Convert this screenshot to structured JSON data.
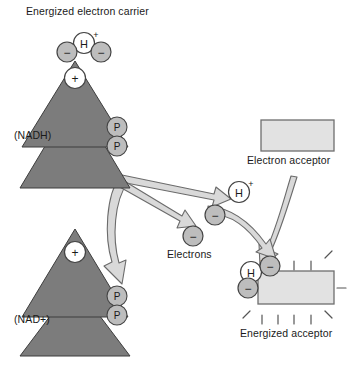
{
  "figure": {
    "kind": "biology-diagram",
    "topic": "Electron transfer from NADH to an electron acceptor"
  },
  "labels": {
    "title": "Energized electron carrier",
    "carrier_reduced": "(NADH)",
    "carrier_oxidized": "(NAD+)",
    "electrons": "Electrons",
    "electron_acceptor": "Electron acceptor",
    "energized_acceptor": "Energized acceptor"
  },
  "glyphs": {
    "hydrogen": "H",
    "plus": "+",
    "minus": "−",
    "phosphate": "P",
    "superscript_plus": "+"
  },
  "colors": {
    "triangle_fill": "#7c7c7c",
    "triangle_stroke": "#3d3d3d",
    "circle_gray_fill": "#bdbdbd",
    "circle_white_fill": "#ffffff",
    "circle_stroke": "#444444",
    "box_fill": "#e2e2e2",
    "box_stroke": "#6e6e6e",
    "arrow_fill": "#d9d9d9",
    "arrow_stroke": "#6b6b6b",
    "text": "#1a1a1a",
    "background": "#ffffff"
  },
  "nodes": {
    "nadh": {
      "label": "(NADH)",
      "charge": "+",
      "has_hydrogen": true,
      "electrons_attached": 2,
      "phosphates": 2
    },
    "nad_plus": {
      "label": "(NAD+)",
      "charge": "+",
      "has_hydrogen": false,
      "electrons_attached": 0,
      "phosphates": 2
    },
    "acceptor": {
      "label": "Electron acceptor",
      "energized": false
    },
    "acceptor_energized": {
      "label": "Energized acceptor",
      "energized": true,
      "has_hydrogen": true,
      "charge": "+",
      "electrons_attached": 2,
      "radiating_lines": 9
    },
    "free_particles": {
      "proton_label": "H",
      "proton_charge": "+",
      "electron_count": 2,
      "group_label": "Electrons"
    }
  }
}
